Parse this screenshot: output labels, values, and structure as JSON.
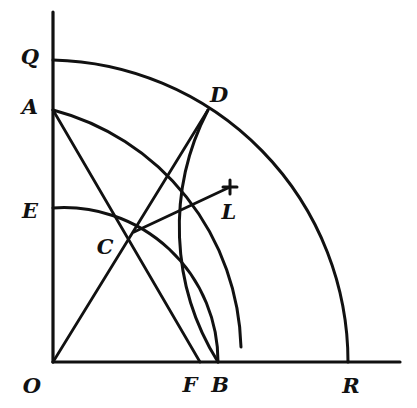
{
  "figure": {
    "background_color": "#ffffff",
    "stroke_color": "#111111",
    "width": 417,
    "height": 408
  },
  "axes": {
    "vertical": {
      "name": "vertical-axis",
      "x": 53,
      "y_top": 12,
      "y_bottom": 362
    },
    "horizontal": {
      "name": "horizontal-axis",
      "y": 362,
      "x_left": 53,
      "x_right": 400
    }
  },
  "points": [
    {
      "id": "Q",
      "label": "Q",
      "x": 53,
      "y": 60,
      "label_x": 30,
      "label_y": 58
    },
    {
      "id": "A",
      "label": "A",
      "x": 53,
      "y": 110,
      "label_x": 30,
      "label_y": 108
    },
    {
      "id": "E",
      "label": "E",
      "x": 53,
      "y": 208,
      "label_x": 30,
      "label_y": 212
    },
    {
      "id": "O",
      "label": "O",
      "x": 53,
      "y": 362,
      "label_x": 32,
      "label_y": 387
    },
    {
      "id": "C",
      "label": "C",
      "x": 134,
      "y": 232,
      "label_x": 105,
      "label_y": 248
    },
    {
      "id": "D",
      "label": "D",
      "x": 208,
      "y": 110,
      "label_x": 219,
      "label_y": 96
    },
    {
      "id": "L",
      "label": "L",
      "x": 230,
      "y": 187,
      "label_x": 229,
      "label_y": 213
    },
    {
      "id": "F",
      "label": "F",
      "x": 200,
      "y": 362,
      "label_x": 190,
      "label_y": 386
    },
    {
      "id": "B",
      "label": "B",
      "x": 218,
      "y": 362,
      "label_x": 220,
      "label_y": 386
    },
    {
      "id": "R",
      "label": "R",
      "x": 348,
      "y": 362,
      "label_x": 351,
      "label_y": 387
    }
  ],
  "arcs": [
    {
      "id": "arc-QR",
      "name": "outer-arc-Q-to-R",
      "from": "Q",
      "to": "R",
      "center": "O",
      "radius": 302,
      "path": "M 53 60 A 302 302 0 0 1 348 362"
    },
    {
      "id": "arc-AB",
      "name": "arc-A-through-D-to-B",
      "from": "A",
      "through": "D",
      "to": "B",
      "center": "O",
      "radius": 252,
      "path": "M 53 110 A 252 252 0 0 1 241 347"
    },
    {
      "id": "arc-EB",
      "name": "arc-E-through-C-to-B",
      "from": "E",
      "through": "C",
      "to": "B",
      "center": "O",
      "radius": 154,
      "path": "M 53 208 A 154 154 0 0 1 218 362"
    },
    {
      "id": "arc-DB",
      "name": "arc-D-to-B",
      "from": "D",
      "to": "B",
      "center": "F",
      "radius": 254,
      "path": "M 208 110 A 254 254 0 0 0 218 362"
    }
  ],
  "segments": [
    {
      "id": "seg-OCD",
      "name": "line-O-through-C-to-D",
      "from": "O",
      "through": "C",
      "to": "D",
      "path": "M 53 362 L 208 110"
    },
    {
      "id": "seg-ACF",
      "name": "line-A-through-C-to-F",
      "from": "A",
      "through": "C",
      "to": "F",
      "path": "M 53 110 L 200 362"
    },
    {
      "id": "seg-CL",
      "name": "ray-C-to-L",
      "from": "C",
      "to": "L",
      "path": "M 134 232 L 230 187"
    }
  ],
  "markers": [
    {
      "id": "cross-L",
      "name": "cross-marker-L",
      "x": 230,
      "y": 187,
      "size": 7
    }
  ]
}
